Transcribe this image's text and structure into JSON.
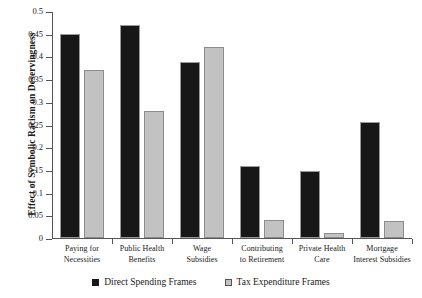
{
  "chart_data": {
    "type": "bar",
    "title": "",
    "xlabel": "",
    "ylabel": "Effect of Symbolic Racism on Deservingness",
    "ylim": [
      0,
      0.5
    ],
    "yticks": [
      "0",
      "0.05",
      "0.1",
      "0.15",
      "0.2",
      "0.25",
      "0.3",
      "0.35",
      "0.4",
      "0.45",
      "0.5"
    ],
    "ytick_values": [
      0,
      0.05,
      0.1,
      0.15,
      0.2,
      0.25,
      0.3,
      0.35,
      0.4,
      0.45,
      0.5
    ],
    "grid": false,
    "legend_position": "bottom",
    "categories": [
      "Paying for Necessities",
      "Public Health Benefits",
      "Wage Subsidies",
      "Contributing to Retirement",
      "Private Health Care",
      "Mortgage Interest Subsidies"
    ],
    "category_lines": [
      [
        "Paying for",
        "Necessities"
      ],
      [
        "Public Health",
        "Benefits"
      ],
      [
        "Wage",
        "Subsidies"
      ],
      [
        "Contributing",
        "to Retirement"
      ],
      [
        "Private Health",
        "Care"
      ],
      [
        "Mortgage",
        "Interest Subsidies"
      ]
    ],
    "series": [
      {
        "name": "Direct Spending Frames",
        "color": "#171717",
        "values": [
          0.45,
          0.47,
          0.388,
          0.158,
          0.148,
          0.255
        ]
      },
      {
        "name": "Tax Expenditure Frames",
        "color": "#c2c2c2",
        "values": [
          0.37,
          0.28,
          0.42,
          0.04,
          0.012,
          0.037
        ]
      }
    ]
  },
  "legend": {
    "items": [
      {
        "label": "Direct Spending Frames",
        "swatch": "dark-square-icon"
      },
      {
        "label": "Tax Expenditure Frames",
        "swatch": "light-square-icon"
      }
    ]
  }
}
